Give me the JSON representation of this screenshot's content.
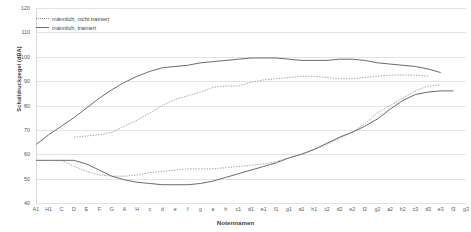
{
  "chart_data": {
    "type": "line",
    "title": "",
    "xlabel": "Notennamen",
    "ylabel": "Schalldruckpegel (dBA)",
    "ylim": [
      40,
      120
    ],
    "yticks": [
      40,
      50,
      60,
      70,
      80,
      90,
      100,
      110,
      120
    ],
    "grid": true,
    "legend_position": "top-left",
    "categories": [
      "A1",
      "H1",
      "C",
      "D",
      "E",
      "F",
      "G",
      "A",
      "H",
      "c",
      "d",
      "e",
      "f",
      "g",
      "a",
      "h",
      "c1",
      "d1",
      "e1",
      "f1",
      "g1",
      "a1",
      "h1",
      "c2",
      "d2",
      "e2",
      "f2",
      "g2",
      "a2",
      "h2",
      "c3",
      "d3",
      "e3",
      "f3",
      "g3"
    ],
    "series": [
      {
        "name": "männlich, nicht trainiert (max)",
        "style": "dotted",
        "color": "#9a9a9a",
        "values": [
          null,
          null,
          null,
          67,
          67.5,
          68,
          69,
          71.5,
          74,
          77,
          80,
          82.5,
          84,
          85.5,
          87.5,
          88,
          88,
          89.5,
          90.5,
          91,
          91.5,
          92,
          92,
          91.5,
          91,
          91,
          91.5,
          92,
          92.5,
          92.5,
          92.5,
          92,
          null,
          null,
          null
        ]
      },
      {
        "name": "männlich, nicht trainiert (min)",
        "style": "dotted",
        "color": "#9a9a9a",
        "values": [
          null,
          null,
          57.5,
          55,
          53,
          51.5,
          51,
          51,
          51.5,
          52.5,
          53,
          53.5,
          54,
          54,
          54,
          54.5,
          55,
          55.5,
          56,
          57,
          58.5,
          60,
          62,
          64,
          66.5,
          69,
          72.5,
          77,
          80,
          83,
          86,
          88,
          88.5,
          null,
          null
        ]
      },
      {
        "name": "männlich, trainiert (max)",
        "style": "solid",
        "color": "#6b6b6b",
        "values": [
          64,
          68,
          71.5,
          75,
          79,
          83,
          86.5,
          89.5,
          92,
          94,
          95.5,
          96,
          96.5,
          97.5,
          98,
          98.5,
          99,
          99.5,
          99.5,
          99.5,
          99,
          98.5,
          98.5,
          98.5,
          99,
          99,
          98.5,
          97.5,
          97,
          96.5,
          96,
          95,
          93.5,
          null,
          null
        ]
      },
      {
        "name": "männlich, trainiert (min)",
        "style": "solid",
        "color": "#6b6b6b",
        "values": [
          57.5,
          57.5,
          57.5,
          57.5,
          56,
          53.5,
          51,
          49.5,
          48.5,
          48,
          47.5,
          47.5,
          47.5,
          48,
          49,
          50.5,
          52,
          53.5,
          55,
          56.5,
          58.5,
          60,
          62,
          64.5,
          67,
          69,
          71.5,
          74.5,
          78.5,
          82,
          84.5,
          85.5,
          86,
          86,
          null
        ]
      }
    ]
  },
  "legend": {
    "items": [
      {
        "label": "männlich, nicht trainiert",
        "style": "dotted"
      },
      {
        "label": "männlich, trainiert",
        "style": "solid"
      }
    ]
  }
}
